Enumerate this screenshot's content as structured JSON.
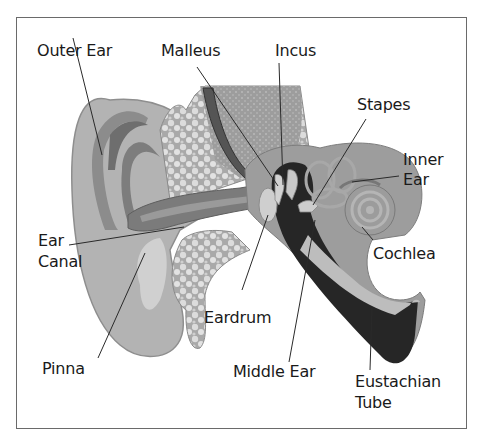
{
  "diagram": {
    "labels": {
      "outer_ear": "Outer Ear",
      "malleus": "Malleus",
      "incus": "Incus",
      "stapes": "Stapes",
      "inner_ear_line1": "Inner",
      "inner_ear_line2": "Ear",
      "ear_canal_line1": "Ear",
      "ear_canal_line2": "Canal",
      "cochlea": "Cochlea",
      "eardrum": "Eardrum",
      "pinna": "Pinna",
      "middle_ear": "Middle Ear",
      "eustachian_line1": "Eustachian",
      "eustachian_line2": "Tube"
    },
    "colors": {
      "skin_light": "#b9b9b9",
      "skin_mid": "#9c9c9c",
      "skin_dark": "#6e6e6e",
      "bone": "#d6d6d6",
      "cavity": "#262626",
      "border": "#6a6a6a",
      "text": "#1a1a1a"
    }
  }
}
